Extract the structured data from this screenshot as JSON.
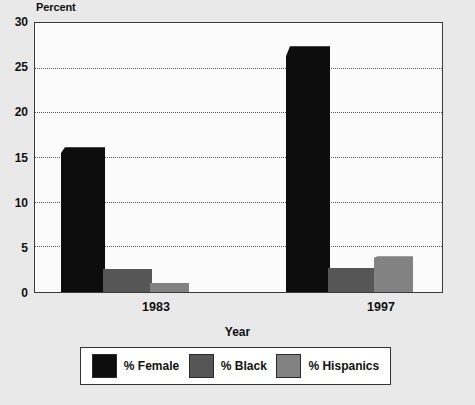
{
  "chart_data": {
    "type": "bar",
    "title": "",
    "xlabel": "Year",
    "ylabel": "Percent",
    "categories": [
      "1983",
      "1997"
    ],
    "series": [
      {
        "name": "% Female",
        "values": [
          16.2,
          27.5
        ],
        "color": "#0d0d0d"
      },
      {
        "name": "% Black",
        "values": [
          2.6,
          2.7
        ],
        "color": "#565656"
      },
      {
        "name": "% Hispanics",
        "values": [
          1.0,
          4.0
        ],
        "color": "#828282"
      }
    ],
    "ylim": [
      0,
      30
    ],
    "yticks": [
      0,
      5,
      10,
      15,
      20,
      25,
      30
    ],
    "ytick_labels": [
      "0",
      "5",
      "10",
      "15",
      "20",
      "25",
      "30"
    ],
    "grid": true,
    "grid_style": "dotted",
    "legend_position": "bottom"
  },
  "axes": {
    "y_title": "Percent",
    "x_title": "Year",
    "y_ticks": [
      "30",
      "25",
      "20",
      "15",
      "10",
      "5",
      "0"
    ],
    "x_ticks": [
      "1983",
      "1997"
    ]
  },
  "legend": {
    "items": [
      {
        "label": "% Female",
        "color": "#0d0d0d"
      },
      {
        "label": "% Black",
        "color": "#565656"
      },
      {
        "label": "% Hispanics",
        "color": "#828282"
      }
    ]
  },
  "colors": {
    "background": "#e9e9e9",
    "plot_background": "#fbfbfb",
    "frame": "#3a3a3a",
    "grid": "#5a5a5a",
    "text": "#111111"
  }
}
